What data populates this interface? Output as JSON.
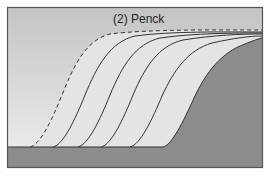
{
  "diagram": {
    "title": "(2) Penck",
    "colors": {
      "sky_top": "#c4c4c4",
      "sky_bottom": "#efefef",
      "regolith": "#e4e4e4",
      "bedrock": "#8c8c8c",
      "line": "#333333",
      "frame": "#555555"
    },
    "profiles": [
      {
        "style": "dashed",
        "foot_x": 30
      },
      {
        "style": "solid",
        "foot_x": 53
      },
      {
        "style": "solid",
        "foot_x": 78
      },
      {
        "style": "solid",
        "foot_x": 101
      },
      {
        "style": "solid",
        "foot_x": 130
      },
      {
        "style": "bedrock",
        "foot_x": 163
      }
    ]
  }
}
